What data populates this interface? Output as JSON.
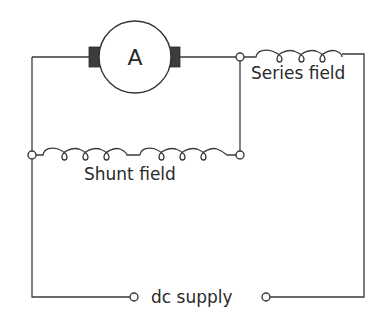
{
  "diagram": {
    "type": "dc compound motor circuit (long-shunt)",
    "armature": {
      "label": "A"
    },
    "series_field": {
      "label": "Series field"
    },
    "shunt_field": {
      "label": "Shunt field"
    },
    "supply": {
      "label": "dc supply"
    },
    "colors": {
      "line": "#3a3a3a",
      "brush": "#3c3c3c",
      "background": "#ffffff"
    }
  }
}
